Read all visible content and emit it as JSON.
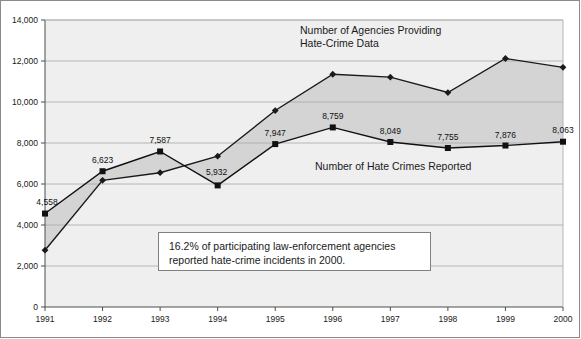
{
  "chart_data": {
    "type": "line",
    "title": "",
    "xlabel": "",
    "ylabel": "",
    "categories": [
      "1991",
      "1992",
      "1993",
      "1994",
      "1995",
      "1996",
      "1997",
      "1998",
      "1999",
      "2000"
    ],
    "ylim": [
      0,
      14000
    ],
    "ytick_labels": [
      "0",
      "2,000",
      "4,000",
      "6,000",
      "8,000",
      "10,000",
      "12,000",
      "14,000"
    ],
    "ytick_values": [
      0,
      2000,
      4000,
      6000,
      8000,
      10000,
      12000,
      14000
    ],
    "grid": true,
    "legend_position": "inline-annotation",
    "series": [
      {
        "name": "Number of Agencies Providing Hate-Crime Data",
        "marker": "diamond",
        "values": [
          2771,
          6181,
          6551,
          7356,
          9584,
          11354,
          11211,
          10461,
          12122,
          11690
        ],
        "labels": [
          "",
          "",
          "",
          "",
          "",
          "",
          "",
          "",
          "",
          ""
        ],
        "color": "#1a1a1a"
      },
      {
        "name": "Number of Hate Crimes Reported",
        "marker": "square",
        "values": [
          4558,
          6623,
          7587,
          5932,
          7947,
          8759,
          8049,
          7755,
          7876,
          8063
        ],
        "labels": [
          "4,558",
          "6,623",
          "7,587",
          "5,932",
          "7,947",
          "8,759",
          "8,049",
          "7,755",
          "7,876",
          "8,063"
        ],
        "color": "#111111"
      }
    ],
    "annotations": [
      {
        "id": "agencies-series-label",
        "line1": "Number of Agencies Providing",
        "line2": "Hate-Crime Data"
      },
      {
        "id": "hate-crimes-series-label",
        "line1": "Number of Hate Crimes Reported",
        "line2": ""
      },
      {
        "id": "note-box",
        "line1": "16.2% of participating law-enforcement agencies",
        "line2": "reported hate-crime incidents in 2000."
      }
    ],
    "colors": {
      "band_fill": "#d4d4d4",
      "plot_bg": "#efefef",
      "gridline": "#a8a8a8",
      "axis": "#4d4d4d",
      "line": "#1a1a1a",
      "note_border": "#808080",
      "note_bg": "#ffffff",
      "frame": "#8a8a8a"
    }
  }
}
